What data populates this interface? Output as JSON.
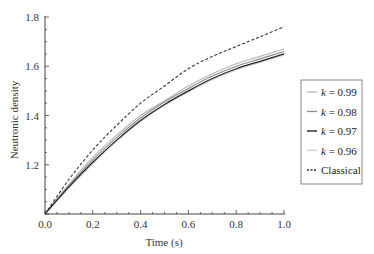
{
  "chart_data": {
    "type": "line",
    "title": "",
    "xlabel": "Time (s)",
    "ylabel": "Neutronic density",
    "xlim": [
      0.0,
      1.0
    ],
    "ylim": [
      1.0,
      1.8
    ],
    "xticks": [
      "0.0",
      "0.2",
      "0.4",
      "0.6",
      "0.8",
      "1.0"
    ],
    "yticks": [
      "1.2",
      "1.4",
      "1.6",
      "1.8"
    ],
    "grid": false,
    "legend_position": "right-outside",
    "x": [
      0.0,
      0.1,
      0.2,
      0.3,
      0.4,
      0.5,
      0.6,
      0.7,
      0.8,
      0.9,
      1.0
    ],
    "series": [
      {
        "name": "k = 0.99",
        "color": "#b5b5b5",
        "dash": "",
        "width": 1.1,
        "values": [
          1.0,
          1.12,
          1.23,
          1.32,
          1.4,
          1.46,
          1.52,
          1.57,
          1.61,
          1.64,
          1.67
        ]
      },
      {
        "name": "k = 0.98",
        "color": "#8a8a8a",
        "dash": "",
        "width": 1.1,
        "values": [
          1.0,
          1.115,
          1.22,
          1.31,
          1.39,
          1.455,
          1.51,
          1.56,
          1.6,
          1.63,
          1.66
        ]
      },
      {
        "name": "k = 0.97",
        "color": "#222222",
        "dash": "",
        "width": 1.2,
        "values": [
          1.0,
          1.11,
          1.21,
          1.3,
          1.38,
          1.445,
          1.5,
          1.55,
          1.59,
          1.62,
          1.65
        ]
      },
      {
        "name": "k = 0.96",
        "color": "#d0d0d0",
        "dash": "",
        "width": 1.1,
        "values": [
          1.0,
          1.105,
          1.205,
          1.295,
          1.375,
          1.44,
          1.495,
          1.545,
          1.585,
          1.615,
          1.645
        ]
      },
      {
        "name": "Classical",
        "color": "#333333",
        "dash": "3,2",
        "width": 1.1,
        "values": [
          1.0,
          1.14,
          1.26,
          1.36,
          1.45,
          1.52,
          1.59,
          1.64,
          1.68,
          1.72,
          1.76
        ]
      }
    ]
  },
  "legend": {
    "items": [
      {
        "prefix": "k",
        "label": " = 0.99"
      },
      {
        "prefix": "k",
        "label": " = 0.98"
      },
      {
        "prefix": "k",
        "label": " = 0.97"
      },
      {
        "prefix": "k",
        "label": " = 0.96"
      },
      {
        "prefix": "",
        "label": "Classical"
      }
    ]
  }
}
